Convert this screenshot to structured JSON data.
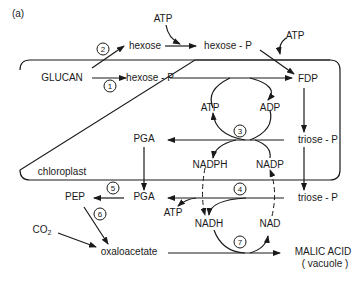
{
  "figure": {
    "panel_label": "(a)",
    "compartment_label": "chloroplast"
  },
  "nodes": {
    "atp_top": "ATP",
    "atp_top_right": "ATP",
    "hexose": "hexose",
    "hexose_p_outer": "hexose - P",
    "glucan": "GLUCAN",
    "hexose_p_inner": "hexose - P",
    "fdp": "FDP",
    "atp_cycle3": "ATP",
    "adp_cycle3": "ADP",
    "pga_inner": "PGA",
    "triose_p_inner": "triose - P",
    "nadph": "NADPH",
    "nadp": "NADP",
    "pep": "PEP",
    "pga_outer": "PGA",
    "atp_cycle4": "ATP",
    "triose_p_outer": "triose - P",
    "nadh": "NADH",
    "nad": "NAD",
    "co2": "CO",
    "co2_sub": "2",
    "oxaloacetate": "oxaloacetate",
    "malic_acid": "MALIC ACID",
    "vacuole": "( vacuole )"
  },
  "steps": [
    "1",
    "2",
    "3",
    "4",
    "5",
    "6",
    "7"
  ],
  "colors": {
    "ink": "#1a1a1a",
    "background": "#ffffff"
  }
}
